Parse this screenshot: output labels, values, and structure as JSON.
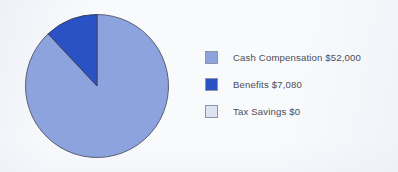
{
  "chart_data": {
    "type": "pie",
    "title": "",
    "categories": [
      "Cash Compensation",
      "Benefits",
      "Tax Savings"
    ],
    "values": [
      52000,
      7080,
      0
    ],
    "value_labels": [
      "$52,000",
      "$7,080",
      "$0"
    ],
    "legend_labels": [
      "Cash Compensation $52,000",
      "Benefits $7,080",
      "Tax Savings $0"
    ],
    "colors": [
      "#8da3dd",
      "#2a52c4",
      "#dde3f3"
    ],
    "percentages": [
      88.0,
      12.0,
      0.0
    ],
    "legend_position": "right",
    "grid": false,
    "start_angle_deg": 0,
    "direction": "counterclockwise",
    "slice_outline_color": "#5a5f72",
    "background_color": "#f9fafc"
  },
  "legend": {
    "items": [
      {
        "label": "Cash Compensation $52,000",
        "color": "#8da3dd"
      },
      {
        "label": "Benefits $7,080",
        "color": "#2a52c4"
      },
      {
        "label": "Tax Savings $0",
        "color": "#dde3f3"
      }
    ]
  }
}
